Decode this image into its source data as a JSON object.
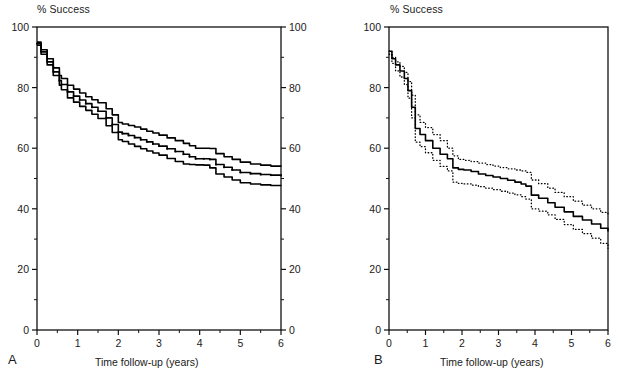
{
  "figure": {
    "panels": [
      {
        "letter": "A",
        "y_axis_title": "% Success",
        "x_axis_title": "Time follow-up (years)"
      },
      {
        "letter": "B",
        "y_axis_title": "% Success",
        "x_axis_title": "Time follow-up (years)"
      }
    ]
  },
  "chart_data": [
    {
      "type": "line",
      "panel": "A",
      "title": "",
      "xlabel": "Time follow-up (years)",
      "ylabel": "% Success",
      "xlim": [
        0,
        6
      ],
      "ylim": [
        0,
        100
      ],
      "xticks": [
        0,
        1,
        2,
        3,
        4,
        5,
        6
      ],
      "xtick_labels": [
        "0",
        "1",
        "2",
        "3",
        "4",
        "5",
        "6"
      ],
      "x_minor_ticks": [
        0.5,
        1.5,
        2.5,
        3.5,
        4.5,
        5.5
      ],
      "yticks": [
        0,
        20,
        40,
        60,
        80,
        100
      ],
      "ytick_labels": [
        "0",
        "20",
        "40",
        "60",
        "80",
        "100"
      ],
      "y_minor_ticks": [
        10,
        30,
        50,
        70,
        90
      ],
      "y_axis_both_sides": true,
      "grid": false,
      "legend": "none",
      "line_style": "solid",
      "marker": "small-dot-on-central-curve",
      "series": [
        {
          "name": "Upper 95% confidence limit",
          "style": "solid",
          "x": [
            0.0,
            0.1,
            0.25,
            0.4,
            0.55,
            0.6,
            0.75,
            0.9,
            1.05,
            1.2,
            1.35,
            1.5,
            1.7,
            1.85,
            2.0,
            2.1,
            2.25,
            2.4,
            2.55,
            2.7,
            2.85,
            3.0,
            3.2,
            3.4,
            3.6,
            3.75,
            3.9,
            4.1,
            4.25,
            4.4,
            4.6,
            4.8,
            5.0,
            5.25,
            5.5,
            5.75,
            6.0
          ],
          "y": [
            95.0,
            92.5,
            89.5,
            86.5,
            84.0,
            83.0,
            80.8,
            79.5,
            78.2,
            77.0,
            76.0,
            75.0,
            73.0,
            71.0,
            68.5,
            68.0,
            67.5,
            67.0,
            66.3,
            65.6,
            65.0,
            64.3,
            63.4,
            62.5,
            61.6,
            60.8,
            60.0,
            60.0,
            59.9,
            58.2,
            57.2,
            56.3,
            55.4,
            54.8,
            54.4,
            54.1,
            54.0
          ]
        },
        {
          "name": "Central estimate (Kaplan-Meier success)",
          "style": "solid-with-markers",
          "x": [
            0.0,
            0.1,
            0.25,
            0.4,
            0.55,
            0.6,
            0.75,
            0.9,
            1.05,
            1.2,
            1.35,
            1.5,
            1.7,
            1.85,
            2.0,
            2.1,
            2.25,
            2.4,
            2.55,
            2.7,
            2.85,
            3.0,
            3.2,
            3.4,
            3.6,
            3.75,
            3.9,
            4.1,
            4.25,
            4.4,
            4.6,
            4.8,
            5.0,
            5.25,
            5.5,
            5.75,
            6.0
          ],
          "y": [
            94.5,
            91.8,
            88.5,
            85.2,
            82.3,
            81.0,
            78.6,
            77.2,
            75.9,
            74.7,
            73.5,
            72.2,
            70.0,
            67.8,
            65.3,
            64.8,
            64.2,
            63.5,
            62.8,
            62.1,
            61.4,
            60.7,
            59.8,
            58.9,
            58.0,
            57.2,
            56.5,
            56.5,
            56.3,
            54.6,
            53.7,
            52.8,
            52.0,
            51.6,
            51.3,
            51.1,
            51.0
          ]
        },
        {
          "name": "Lower 95% confidence limit",
          "style": "solid",
          "x": [
            0.0,
            0.1,
            0.25,
            0.4,
            0.55,
            0.6,
            0.75,
            0.9,
            1.05,
            1.2,
            1.35,
            1.5,
            1.7,
            1.85,
            2.0,
            2.1,
            2.25,
            2.4,
            2.55,
            2.7,
            2.85,
            3.0,
            3.2,
            3.4,
            3.6,
            3.75,
            3.9,
            4.1,
            4.25,
            4.4,
            4.6,
            4.8,
            5.0,
            5.25,
            5.5,
            5.75,
            6.0
          ],
          "y": [
            94.0,
            91.0,
            87.5,
            84.0,
            80.8,
            79.3,
            76.6,
            75.2,
            73.8,
            72.5,
            71.2,
            69.8,
            67.4,
            65.2,
            62.8,
            62.2,
            61.4,
            60.6,
            59.8,
            59.1,
            58.4,
            57.7,
            56.6,
            55.6,
            54.8,
            54.6,
            54.5,
            54.4,
            53.5,
            51.5,
            50.5,
            49.5,
            48.6,
            48.2,
            47.9,
            47.7,
            47.6
          ]
        }
      ]
    },
    {
      "type": "line",
      "panel": "B",
      "title": "",
      "xlabel": "Time follow-up (years)",
      "ylabel": "% Success",
      "xlim": [
        0,
        6
      ],
      "ylim": [
        0,
        100
      ],
      "xticks": [
        0,
        1,
        2,
        3,
        4,
        5,
        6
      ],
      "xtick_labels": [
        "0",
        "1",
        "2",
        "3",
        "4",
        "5",
        "6"
      ],
      "x_minor_ticks": [
        0.5,
        1.5,
        2.5,
        3.5,
        4.5,
        5.5
      ],
      "yticks": [
        0,
        20,
        40,
        60,
        80,
        100
      ],
      "ytick_labels": [
        "0",
        "20",
        "40",
        "60",
        "80",
        "100"
      ],
      "y_minor_ticks": [
        10,
        30,
        50,
        70,
        90
      ],
      "y_axis_both_sides": false,
      "grid": false,
      "legend": "none",
      "series": [
        {
          "name": "Upper 95% confidence limit",
          "style": "dotted",
          "x": [
            0.0,
            0.08,
            0.18,
            0.3,
            0.42,
            0.52,
            0.62,
            0.72,
            0.85,
            1.0,
            1.2,
            1.4,
            1.6,
            1.75,
            1.9,
            2.05,
            2.25,
            2.45,
            2.65,
            2.85,
            3.05,
            3.25,
            3.45,
            3.62,
            3.75,
            3.9,
            4.1,
            4.35,
            4.55,
            4.8,
            5.05,
            5.3,
            5.55,
            5.8,
            6.0
          ],
          "y": [
            92.0,
            90.0,
            88.5,
            87.0,
            85.0,
            82.0,
            77.5,
            71.0,
            68.5,
            66.8,
            64.5,
            62.5,
            60.0,
            57.5,
            56.3,
            56.0,
            55.6,
            55.1,
            54.6,
            54.1,
            53.6,
            53.2,
            52.8,
            52.5,
            52.0,
            49.5,
            48.3,
            46.8,
            45.4,
            44.0,
            42.5,
            41.2,
            40.0,
            38.8,
            38.0
          ]
        },
        {
          "name": "Central estimate (Kaplan-Meier success)",
          "style": "solid",
          "x": [
            0.0,
            0.08,
            0.18,
            0.3,
            0.42,
            0.52,
            0.62,
            0.72,
            0.85,
            1.0,
            1.2,
            1.4,
            1.6,
            1.75,
            1.9,
            2.05,
            2.25,
            2.45,
            2.65,
            2.85,
            3.05,
            3.25,
            3.45,
            3.62,
            3.75,
            3.9,
            4.1,
            4.35,
            4.55,
            4.8,
            5.05,
            5.3,
            5.55,
            5.8,
            6.0
          ],
          "y": [
            92.0,
            89.5,
            87.5,
            85.5,
            83.0,
            79.0,
            73.5,
            66.5,
            64.5,
            62.5,
            60.0,
            58.0,
            56.5,
            53.5,
            53.0,
            52.8,
            52.3,
            51.5,
            51.0,
            50.5,
            50.0,
            49.4,
            48.8,
            48.2,
            47.5,
            44.5,
            43.5,
            42.0,
            40.5,
            39.0,
            37.5,
            36.3,
            35.0,
            33.6,
            32.5
          ]
        },
        {
          "name": "Lower 95% confidence limit",
          "style": "dotted",
          "x": [
            0.0,
            0.08,
            0.18,
            0.3,
            0.42,
            0.52,
            0.62,
            0.72,
            0.85,
            1.0,
            1.2,
            1.4,
            1.6,
            1.75,
            1.9,
            2.05,
            2.25,
            2.45,
            2.65,
            2.85,
            3.05,
            3.25,
            3.45,
            3.62,
            3.75,
            3.9,
            4.1,
            4.35,
            4.55,
            4.8,
            5.05,
            5.3,
            5.55,
            5.8,
            6.0
          ],
          "y": [
            91.0,
            88.0,
            85.5,
            83.5,
            81.0,
            76.5,
            70.0,
            62.0,
            60.5,
            58.5,
            56.0,
            54.0,
            52.5,
            48.8,
            48.4,
            48.2,
            47.8,
            47.3,
            46.8,
            46.3,
            45.8,
            45.2,
            44.6,
            44.0,
            43.2,
            40.0,
            39.2,
            38.0,
            36.5,
            34.8,
            33.2,
            31.8,
            30.3,
            28.6,
            27.0
          ]
        }
      ]
    }
  ]
}
